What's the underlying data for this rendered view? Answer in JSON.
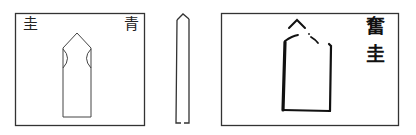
{
  "figure": {
    "panels": [
      {
        "id": "panel-left",
        "labels": {
          "top_left": "圭",
          "top_right": "青"
        },
        "shape": "gui-tablet-notched"
      },
      {
        "id": "panel-middle",
        "shape": "gui-tablet-side-view"
      },
      {
        "id": "panel-right",
        "labels": {
          "vertical_right": [
            "奮",
            "圭"
          ]
        },
        "shape": "gui-tablet-bold"
      }
    ],
    "colors": {
      "line": "#333333",
      "bold_line": "#111111",
      "background": "#ffffff"
    }
  }
}
